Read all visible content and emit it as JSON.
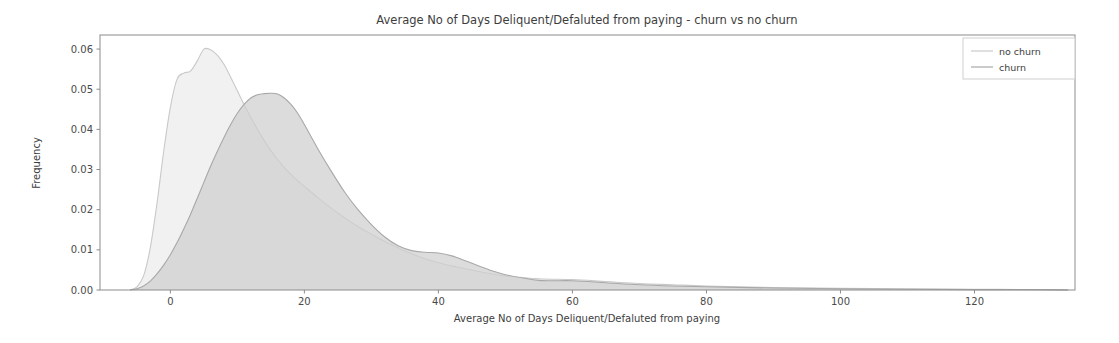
{
  "chart_data": {
    "type": "area",
    "title": "Average No of Days Deliquent/Defaluted from paying - churn vs no churn",
    "xlabel": "Average No of Days Deliquent/Defaluted from paying",
    "ylabel": "Frequency",
    "xlim": [
      -10.5,
      135
    ],
    "ylim": [
      0.0,
      0.0635
    ],
    "grid": false,
    "legend_position": "upper right",
    "xticks": [
      0,
      20,
      40,
      60,
      80,
      100,
      120
    ],
    "xtick_labels": [
      "0",
      "20",
      "40",
      "60",
      "80",
      "100",
      "120"
    ],
    "yticks": [
      0.0,
      0.01,
      0.02,
      0.03,
      0.04,
      0.05,
      0.06
    ],
    "ytick_labels": [
      "0.00",
      "0.01",
      "0.02",
      "0.03",
      "0.04",
      "0.05",
      "0.06"
    ],
    "series": [
      {
        "name": "no churn",
        "color": "#c9c9c9",
        "fill_color": "#e8e8e8",
        "x": [
          -6,
          -5,
          -4,
          -3,
          -2,
          -1,
          0,
          1,
          2,
          3,
          4,
          5,
          6,
          7,
          8,
          9,
          10,
          11,
          12,
          13,
          14,
          15,
          16,
          17,
          18,
          19,
          20,
          22,
          24,
          26,
          28,
          30,
          32,
          34,
          36,
          38,
          40,
          42,
          44,
          46,
          48,
          50,
          55,
          60,
          65,
          70,
          75,
          80,
          90,
          100,
          110,
          120,
          130,
          134
        ],
        "values": [
          0.0,
          0.0008,
          0.0035,
          0.0105,
          0.0215,
          0.0345,
          0.0455,
          0.0525,
          0.054,
          0.0545,
          0.057,
          0.06,
          0.0598,
          0.0585,
          0.0562,
          0.053,
          0.0496,
          0.0462,
          0.043,
          0.04,
          0.0372,
          0.0347,
          0.0325,
          0.0305,
          0.0288,
          0.0272,
          0.0258,
          0.023,
          0.0204,
          0.018,
          0.0158,
          0.0139,
          0.0121,
          0.0105,
          0.009,
          0.0078,
          0.0068,
          0.006,
          0.0053,
          0.0046,
          0.004,
          0.0035,
          0.0028,
          0.0026,
          0.0021,
          0.0016,
          0.0013,
          0.001,
          0.0006,
          0.0004,
          0.0003,
          0.0002,
          0.0001,
          0.0
        ]
      },
      {
        "name": "churn",
        "color": "#a8a8a8",
        "fill_color": "#cfcfcf",
        "x": [
          -6,
          -5,
          -4,
          -3,
          -2,
          -1,
          0,
          1,
          2,
          3,
          4,
          5,
          6,
          7,
          8,
          9,
          10,
          11,
          12,
          13,
          14,
          15,
          16,
          17,
          18,
          19,
          20,
          22,
          24,
          26,
          28,
          30,
          32,
          34,
          36,
          38,
          40,
          42,
          44,
          46,
          48,
          50,
          55,
          60,
          65,
          70,
          75,
          80,
          90,
          100,
          110,
          120,
          130,
          134
        ],
        "values": [
          0.0,
          0.0003,
          0.001,
          0.0022,
          0.004,
          0.0062,
          0.0088,
          0.0118,
          0.0152,
          0.0188,
          0.0228,
          0.0268,
          0.0308,
          0.0345,
          0.038,
          0.0412,
          0.044,
          0.0462,
          0.0478,
          0.0486,
          0.0489,
          0.049,
          0.0488,
          0.0478,
          0.0462,
          0.044,
          0.0412,
          0.0352,
          0.0296,
          0.0244,
          0.02,
          0.0163,
          0.0132,
          0.011,
          0.0098,
          0.0094,
          0.0092,
          0.0085,
          0.0073,
          0.006,
          0.0048,
          0.0038,
          0.0024,
          0.0023,
          0.0018,
          0.0013,
          0.001,
          0.0008,
          0.0005,
          0.0003,
          0.0002,
          0.0001,
          0.0001,
          0.0
        ]
      }
    ],
    "legend_entries": [
      {
        "label": "no churn",
        "color": "#c9c9c9"
      },
      {
        "label": "churn",
        "color": "#a8a8a8"
      }
    ]
  },
  "geometry": {
    "plot_left": 100,
    "plot_right": 1075,
    "plot_top": 35,
    "plot_bottom": 290,
    "legend_x": 963,
    "legend_y": 38,
    "legend_w": 112,
    "legend_h": 41
  }
}
